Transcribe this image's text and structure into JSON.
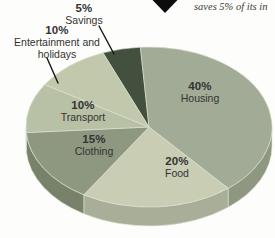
{
  "page": {
    "background": "#fdfdfb",
    "caption_fragment": "saves 5% of its in",
    "marker_icon": "down-triangle",
    "marker_color": "#0d0d0d",
    "label_text_color": "#333333",
    "leader_line_color": "#151515"
  },
  "chart_data": {
    "type": "pie",
    "style": "3d-exploded-none",
    "title": "",
    "legend": "none",
    "start_angle_deg": -22,
    "categories": [
      "Savings",
      "Housing",
      "Food",
      "Clothing",
      "Transport",
      "Entertainment and holidays"
    ],
    "values": [
      5,
      40,
      20,
      15,
      10,
      10
    ],
    "slices": [
      {
        "label": "Savings",
        "pct_label": "5%",
        "value": 5,
        "color": "#44503e",
        "side_color": "#353f30"
      },
      {
        "label": "Housing",
        "pct_label": "40%",
        "value": 40,
        "color": "#a2ab95",
        "side_color": "#8e977f"
      },
      {
        "label": "Food",
        "pct_label": "20%",
        "value": 20,
        "color": "#c8cdb3",
        "side_color": "#a9ae99"
      },
      {
        "label": "Clothing",
        "pct_label": "15%",
        "value": 15,
        "color": "#8e9880",
        "side_color": "#78826a"
      },
      {
        "label": "Transport",
        "pct_label": "10%",
        "value": 10,
        "color": "#b8c0a5",
        "side_color": "#9aa287"
      },
      {
        "label": "Entertainment and holidays",
        "pct_label": "10%",
        "value": 10,
        "color": "#c1c8ac",
        "side_color": "#a5ab90"
      }
    ]
  }
}
